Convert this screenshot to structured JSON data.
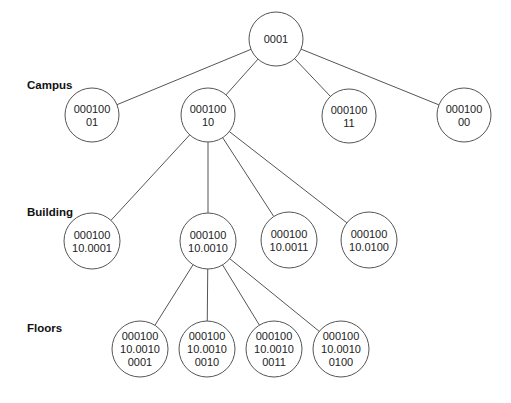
{
  "diagram": {
    "levels": [
      {
        "label": "Campus",
        "x": 27,
        "y": 80
      },
      {
        "label": "Building",
        "x": 27,
        "y": 207
      },
      {
        "label": "Floors",
        "x": 27,
        "y": 323
      }
    ],
    "nodes": [
      {
        "id": "root",
        "lines": [
          "0001"
        ],
        "cx": 276,
        "cy": 39,
        "r": 27
      },
      {
        "id": "campus-01",
        "lines": [
          "000100",
          "01"
        ],
        "cx": 92,
        "cy": 115,
        "r": 27
      },
      {
        "id": "campus-10",
        "lines": [
          "000100",
          "10"
        ],
        "cx": 208,
        "cy": 115,
        "r": 27
      },
      {
        "id": "campus-11",
        "lines": [
          "000100",
          "11"
        ],
        "cx": 349,
        "cy": 116,
        "r": 27
      },
      {
        "id": "campus-00",
        "lines": [
          "000100",
          "00"
        ],
        "cx": 464,
        "cy": 115,
        "r": 27
      },
      {
        "id": "building-0001",
        "lines": [
          "000100",
          "10.0001"
        ],
        "cx": 92,
        "cy": 241,
        "r": 28
      },
      {
        "id": "building-0010",
        "lines": [
          "000100",
          "10.0010"
        ],
        "cx": 208,
        "cy": 241,
        "r": 28
      },
      {
        "id": "building-0011",
        "lines": [
          "000100",
          "10.0011"
        ],
        "cx": 289,
        "cy": 240,
        "r": 28
      },
      {
        "id": "building-0100",
        "lines": [
          "000100",
          "10.0100"
        ],
        "cx": 369,
        "cy": 240,
        "r": 28
      },
      {
        "id": "floor-0001",
        "lines": [
          "000100",
          "10.0010",
          "0001"
        ],
        "cx": 140,
        "cy": 349,
        "r": 28
      },
      {
        "id": "floor-0010",
        "lines": [
          "000100",
          "10.0010",
          "0010"
        ],
        "cx": 207,
        "cy": 349,
        "r": 28
      },
      {
        "id": "floor-0011",
        "lines": [
          "000100",
          "10.0010",
          "0011"
        ],
        "cx": 274,
        "cy": 349,
        "r": 28
      },
      {
        "id": "floor-0100",
        "lines": [
          "000100",
          "10.0010",
          "0100"
        ],
        "cx": 341,
        "cy": 349,
        "r": 28
      }
    ],
    "edges": [
      [
        "root",
        "campus-01"
      ],
      [
        "root",
        "campus-10"
      ],
      [
        "root",
        "campus-11"
      ],
      [
        "root",
        "campus-00"
      ],
      [
        "campus-10",
        "building-0001"
      ],
      [
        "campus-10",
        "building-0010"
      ],
      [
        "campus-10",
        "building-0011"
      ],
      [
        "campus-10",
        "building-0100"
      ],
      [
        "building-0010",
        "floor-0001"
      ],
      [
        "building-0010",
        "floor-0010"
      ],
      [
        "building-0010",
        "floor-0011"
      ],
      [
        "building-0010",
        "floor-0100"
      ]
    ],
    "colors": {
      "stroke": "#555555",
      "text": "#222222",
      "background": "#ffffff"
    }
  }
}
